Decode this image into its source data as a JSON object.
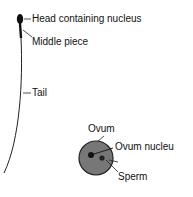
{
  "diagram": {
    "labels": {
      "head": "Head containing nucleus",
      "middle": "Middle piece",
      "tail": "Tail",
      "ovum": "Ovum",
      "ovum_nucleus": "Ovum nucleu",
      "sperm": "Sperm"
    }
  }
}
